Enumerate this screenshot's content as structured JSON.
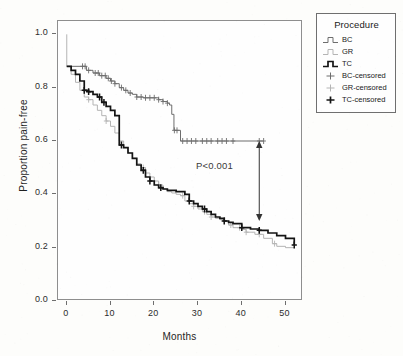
{
  "axes": {
    "ylabel": "Proportion pain-free",
    "xlabel": "Months",
    "yticks": [
      "1.0",
      "0.8",
      "0.6",
      "0.4",
      "0.2",
      "0.0"
    ],
    "xticks": [
      "0",
      "10",
      "20",
      "30",
      "40",
      "50"
    ]
  },
  "annotation": {
    "pvalue": "P<0.001"
  },
  "legend": {
    "title": "Procedure",
    "items": [
      {
        "label": "BC",
        "key": "step-line",
        "color": "#6d6d6d"
      },
      {
        "label": "GR",
        "key": "step-line",
        "color": "#b4b4b4"
      },
      {
        "label": "TC",
        "key": "step-line-bold",
        "color": "#141414"
      },
      {
        "label": "BC-censored",
        "key": "plus-marker",
        "color": "#6d6d6d"
      },
      {
        "label": "GR-censored",
        "key": "plus-marker",
        "color": "#b4b4b4"
      },
      {
        "label": "TC-censored",
        "key": "plus-marker-bold",
        "color": "#141414"
      }
    ]
  },
  "chart_data": {
    "type": "line",
    "title": "",
    "xlabel": "Months",
    "ylabel": "Proportion pain-free",
    "xlim": [
      -2,
      54
    ],
    "ylim": [
      0.0,
      1.05
    ],
    "grid": false,
    "legend_position": "right-outside",
    "curve_style": "kaplan-meier step",
    "annotations": [
      {
        "text": "P<0.001",
        "x": 33,
        "y": 0.455
      },
      {
        "type": "double-arrow",
        "x": 44,
        "y_from": 0.6,
        "y_to": 0.3
      }
    ],
    "series": [
      {
        "name": "BC",
        "color": "#6d6d6d",
        "points": [
          [
            0,
            0.88
          ],
          [
            3.5,
            0.88
          ],
          [
            4.5,
            0.865
          ],
          [
            6,
            0.855
          ],
          [
            7.5,
            0.845
          ],
          [
            9,
            0.835
          ],
          [
            10,
            0.825
          ],
          [
            11,
            0.815
          ],
          [
            12,
            0.8
          ],
          [
            13,
            0.79
          ],
          [
            14,
            0.78
          ],
          [
            15,
            0.775
          ],
          [
            16,
            0.765
          ],
          [
            17.5,
            0.762
          ],
          [
            20,
            0.762
          ],
          [
            21,
            0.755
          ],
          [
            22,
            0.748
          ],
          [
            23,
            0.742
          ],
          [
            23.5,
            0.735
          ],
          [
            24,
            0.7
          ],
          [
            24.5,
            0.64
          ],
          [
            25.5,
            0.64
          ],
          [
            26,
            0.6
          ],
          [
            45,
            0.6
          ]
        ],
        "censored": [
          3.6,
          4.2,
          5.0,
          6.5,
          7.2,
          8.0,
          8.8,
          9.5,
          10.2,
          11.0,
          12.5,
          13.5,
          14.5,
          16.0,
          17.0,
          18.0,
          19.0,
          20.0,
          21.0,
          22.0,
          23.0,
          24.6,
          25.2,
          26.5,
          27.5,
          28.5,
          29.5,
          31.0,
          32.0,
          33.0,
          34.5,
          35.5,
          36.5,
          38.0,
          44.0,
          45.0
        ]
      },
      {
        "name": "GR",
        "color": "#b4b4b4",
        "points": [
          [
            0,
            1.0
          ],
          [
            0,
            0.88
          ],
          [
            1,
            0.85
          ],
          [
            2,
            0.82
          ],
          [
            3,
            0.79
          ],
          [
            4,
            0.765
          ],
          [
            5,
            0.755
          ],
          [
            6,
            0.735
          ],
          [
            7,
            0.715
          ],
          [
            8,
            0.695
          ],
          [
            9,
            0.675
          ],
          [
            10,
            0.655
          ],
          [
            11,
            0.63
          ],
          [
            12,
            0.6
          ],
          [
            13,
            0.575
          ],
          [
            14,
            0.555
          ],
          [
            15,
            0.535
          ],
          [
            16,
            0.515
          ],
          [
            17,
            0.5
          ],
          [
            18,
            0.48
          ],
          [
            19,
            0.465
          ],
          [
            20,
            0.45
          ],
          [
            21,
            0.435
          ],
          [
            22,
            0.42
          ],
          [
            23,
            0.41
          ],
          [
            24,
            0.405
          ],
          [
            25,
            0.4
          ],
          [
            26,
            0.395
          ],
          [
            27,
            0.375
          ],
          [
            28,
            0.365
          ],
          [
            29,
            0.355
          ],
          [
            30,
            0.345
          ],
          [
            31,
            0.335
          ],
          [
            32,
            0.325
          ],
          [
            33,
            0.315
          ],
          [
            34,
            0.31
          ],
          [
            35,
            0.305
          ],
          [
            36,
            0.3
          ],
          [
            37,
            0.285
          ],
          [
            38,
            0.275
          ],
          [
            40,
            0.268
          ],
          [
            41,
            0.258
          ],
          [
            43,
            0.25
          ],
          [
            45,
            0.235
          ],
          [
            47,
            0.215
          ],
          [
            48,
            0.205
          ],
          [
            50,
            0.2
          ],
          [
            52,
            0.2
          ]
        ],
        "censored": [
          5.0,
          9.0,
          17.5,
          21.0,
          26.5,
          29.0,
          31.5,
          33.0,
          36.0,
          37.5,
          39.5,
          41.0,
          44.0,
          47.5
        ]
      },
      {
        "name": "TC",
        "color": "#141414",
        "points": [
          [
            0,
            0.88
          ],
          [
            1,
            0.865
          ],
          [
            2,
            0.85
          ],
          [
            3,
            0.825
          ],
          [
            4,
            0.79
          ],
          [
            5,
            0.785
          ],
          [
            6,
            0.775
          ],
          [
            7,
            0.765
          ],
          [
            8,
            0.745
          ],
          [
            9,
            0.73
          ],
          [
            10,
            0.715
          ],
          [
            11,
            0.695
          ],
          [
            12,
            0.68
          ],
          [
            12,
            0.585
          ],
          [
            13,
            0.575
          ],
          [
            14,
            0.555
          ],
          [
            15,
            0.535
          ],
          [
            16,
            0.51
          ],
          [
            17,
            0.49
          ],
          [
            18,
            0.465
          ],
          [
            19,
            0.45
          ],
          [
            20,
            0.435
          ],
          [
            21,
            0.425
          ],
          [
            22,
            0.42
          ],
          [
            23,
            0.415
          ],
          [
            25,
            0.41
          ],
          [
            27,
            0.4
          ],
          [
            28,
            0.375
          ],
          [
            29,
            0.365
          ],
          [
            30,
            0.355
          ],
          [
            31,
            0.345
          ],
          [
            32,
            0.335
          ],
          [
            33,
            0.325
          ],
          [
            34,
            0.315
          ],
          [
            35,
            0.31
          ],
          [
            36,
            0.3
          ],
          [
            37,
            0.295
          ],
          [
            38,
            0.29
          ],
          [
            40,
            0.275
          ],
          [
            42,
            0.27
          ],
          [
            44,
            0.265
          ],
          [
            46,
            0.255
          ],
          [
            48,
            0.245
          ],
          [
            50,
            0.235
          ],
          [
            52,
            0.21
          ]
        ],
        "censored": [
          4.0,
          5.0,
          7.5,
          8.5,
          12.5,
          17.5,
          19.0,
          21.5,
          28.0,
          31.5,
          36.0,
          40.0,
          44.0,
          52.0
        ]
      }
    ]
  }
}
